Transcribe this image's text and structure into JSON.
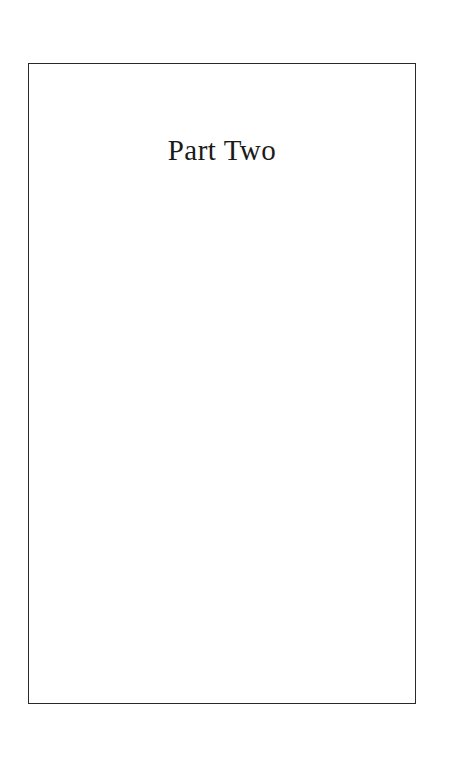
{
  "page": {
    "title": "Part Two",
    "colors": {
      "background": "#ffffff",
      "text": "#1a1a1a",
      "border": "#2a2a2a"
    }
  }
}
